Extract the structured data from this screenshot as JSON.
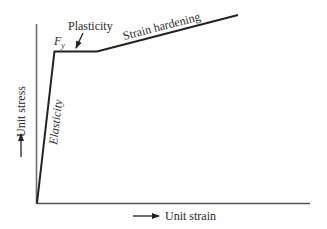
{
  "diagram": {
    "type": "stress-strain curve",
    "axes": {
      "x_label": "Unit strain",
      "y_label": "Unit stress",
      "axis_color": "#555555"
    },
    "curve": {
      "color": "#222222",
      "segments": [
        {
          "name": "Elasticity",
          "from": [
            37,
            203
          ],
          "to": [
            54,
            51
          ]
        },
        {
          "name": "Plasticity",
          "from": [
            54,
            51
          ],
          "to": [
            97,
            51
          ]
        },
        {
          "name": "Strain hardening",
          "from": [
            97,
            51
          ],
          "to": [
            238,
            15
          ]
        }
      ]
    },
    "labels": {
      "yield_point": "F",
      "yield_point_subscript": "y",
      "plasticity": "Plasticity",
      "strain_hardening": "Strain hardening",
      "elasticity": "Elasticity"
    }
  }
}
